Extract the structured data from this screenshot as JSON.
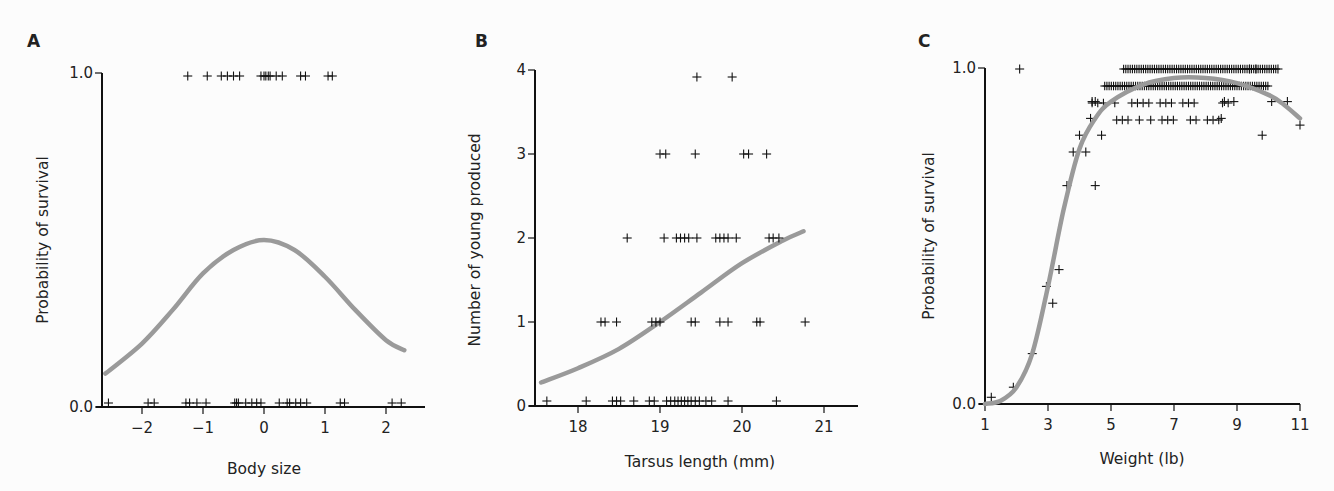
{
  "chart_data": [
    {
      "panel": "A",
      "type": "scatter",
      "title": "",
      "xlabel": "Body size",
      "ylabel": "Probability of survival",
      "xlim": [
        -2.6,
        2.6
      ],
      "ylim": [
        0.0,
        1.0
      ],
      "x_ticks": [
        -2,
        -1,
        0,
        1,
        2
      ],
      "x_tick_labels": [
        "−2",
        "−1",
        "0",
        "1",
        "2"
      ],
      "y_ticks": [
        0.0,
        1.0
      ],
      "y_tick_labels": [
        "0.0",
        "1.0"
      ],
      "grid": false,
      "marker": "+",
      "points_y1": [
        -1.25,
        -0.93,
        -0.7,
        -0.6,
        -0.5,
        -0.4,
        -0.05,
        0.0,
        0.03,
        0.07,
        0.1,
        0.2,
        0.3,
        0.6,
        0.68,
        1.05,
        1.12
      ],
      "points_y0": [
        -2.55,
        -1.9,
        -1.8,
        -1.28,
        -1.22,
        -1.1,
        -0.95,
        -0.48,
        -0.45,
        -0.42,
        -0.3,
        -0.2,
        -0.12,
        -0.05,
        0.25,
        0.38,
        0.42,
        0.52,
        0.6,
        0.7,
        1.25,
        1.32,
        2.1,
        2.25
      ],
      "fit_curve": {
        "x": [
          -2.6,
          -2.0,
          -1.5,
          -1.0,
          -0.5,
          0.0,
          0.5,
          1.0,
          1.5,
          2.0,
          2.3
        ],
        "y": [
          0.1,
          0.19,
          0.29,
          0.4,
          0.47,
          0.5,
          0.47,
          0.39,
          0.29,
          0.2,
          0.17
        ]
      }
    },
    {
      "panel": "B",
      "type": "scatter",
      "title": "",
      "xlabel": "Tarsus length (mm)",
      "ylabel": "Number of young produced",
      "xlim": [
        17.55,
        21.4
      ],
      "ylim": [
        0,
        4
      ],
      "x_ticks": [
        18,
        19,
        20,
        21
      ],
      "x_tick_labels": [
        "18",
        "19",
        "20",
        "21"
      ],
      "y_ticks": [
        0,
        1,
        2,
        3,
        4
      ],
      "y_tick_labels": [
        "0",
        "1",
        "2",
        "3",
        "4"
      ],
      "grid": false,
      "marker": "+",
      "points": {
        "4": [
          19.45,
          19.88
        ],
        "3": [
          19.0,
          19.07,
          19.43,
          20.02,
          20.08,
          20.3
        ],
        "2": [
          18.6,
          19.05,
          19.2,
          19.25,
          19.3,
          19.35,
          19.45,
          19.68,
          19.73,
          19.78,
          19.83,
          19.93,
          20.33,
          20.38,
          20.45
        ],
        "1": [
          18.28,
          18.33,
          18.47,
          18.9,
          18.95,
          19.0,
          19.38,
          19.43,
          19.73,
          19.83,
          20.18,
          20.22,
          20.77
        ],
        "0": [
          17.62,
          18.1,
          18.42,
          18.47,
          18.52,
          18.68,
          18.87,
          18.93,
          19.08,
          19.13,
          19.18,
          19.22,
          19.26,
          19.3,
          19.34,
          19.38,
          19.43,
          19.48,
          19.56,
          19.63,
          19.83,
          20.42
        ]
      },
      "fit_curve": {
        "x": [
          17.55,
          18.0,
          18.5,
          19.0,
          19.5,
          20.0,
          20.5,
          20.75
        ],
        "y": [
          0.28,
          0.45,
          0.68,
          1.0,
          1.35,
          1.7,
          1.97,
          2.08
        ]
      }
    },
    {
      "panel": "C",
      "type": "scatter",
      "title": "",
      "xlabel": "Weight (lb)",
      "ylabel": "Probability of survival",
      "xlim": [
        1,
        11
      ],
      "ylim": [
        0.0,
        1.0
      ],
      "x_ticks": [
        1,
        3,
        5,
        7,
        9,
        11
      ],
      "x_tick_labels": [
        "1",
        "3",
        "5",
        "7",
        "9",
        "11"
      ],
      "y_ticks": [
        0.0,
        1.0
      ],
      "y_tick_labels": [
        "0.0",
        "1.0"
      ],
      "grid": false,
      "marker": "+",
      "points": [
        [
          1.2,
          0.02
        ],
        [
          1.9,
          0.05
        ],
        [
          2.1,
          1.0
        ],
        [
          2.5,
          0.15
        ],
        [
          2.95,
          0.35
        ],
        [
          3.15,
          0.3
        ],
        [
          3.35,
          0.4
        ],
        [
          3.6,
          0.65
        ],
        [
          3.8,
          0.75
        ],
        [
          4.0,
          0.8
        ],
        [
          4.2,
          0.75
        ],
        [
          4.35,
          0.85
        ],
        [
          4.5,
          0.65
        ],
        [
          4.7,
          0.8
        ],
        [
          4.4,
          0.9
        ],
        [
          4.5,
          0.9
        ],
        [
          9.8,
          0.8
        ],
        [
          11.0,
          0.83
        ],
        [
          10.1,
          0.9
        ],
        [
          10.6,
          0.9
        ],
        [
          10.3,
          1.0
        ],
        [
          9.6,
          1.0
        ],
        [
          9.4,
          1.0
        ],
        [
          8.5,
          0.85
        ],
        [
          8.6,
          0.9
        ],
        [
          8.9,
          0.9
        ]
      ],
      "dense_rows": [
        {
          "y": 1.0,
          "x_range": [
            5.4,
            10.3
          ]
        },
        {
          "y": 0.95,
          "x_range": [
            4.8,
            10.0
          ]
        },
        {
          "y": 0.9,
          "x_range": [
            4.4,
            8.9
          ]
        },
        {
          "y": 0.85,
          "x_range": [
            5.0,
            8.5
          ]
        }
      ],
      "fit_curve": {
        "x": [
          1.0,
          1.5,
          2.0,
          2.5,
          3.0,
          3.5,
          4.0,
          4.5,
          5.0,
          6.0,
          7.0,
          8.0,
          9.0,
          10.0,
          10.5,
          11.0
        ],
        "y": [
          0.0,
          0.01,
          0.05,
          0.15,
          0.35,
          0.58,
          0.76,
          0.85,
          0.9,
          0.95,
          0.97,
          0.97,
          0.955,
          0.92,
          0.89,
          0.85
        ]
      }
    }
  ],
  "labels": {
    "panel_a": "A",
    "panel_b": "B",
    "panel_c": "C"
  }
}
